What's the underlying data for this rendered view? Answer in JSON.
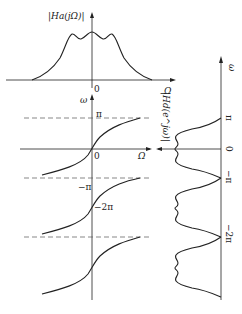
{
  "figure": {
    "top_plot": {
      "y_label": "|Ha(jΩ)|",
      "x_label": "Ω",
      "origin_label": "0"
    },
    "mapping_plot": {
      "y_label": "ω",
      "x_label": "Ω",
      "origin_label": "0",
      "tick_pi": "π",
      "tick_neg_pi": "−π",
      "tick_neg_2pi": "−2π"
    },
    "right_plot": {
      "y_label": "|Hd(e^jω)|",
      "axis_label": "ω",
      "tick_pi": "π",
      "tick_zero": "0",
      "tick_neg_pi": "−π",
      "tick_neg_2pi": "−2π"
    },
    "caption": ""
  }
}
